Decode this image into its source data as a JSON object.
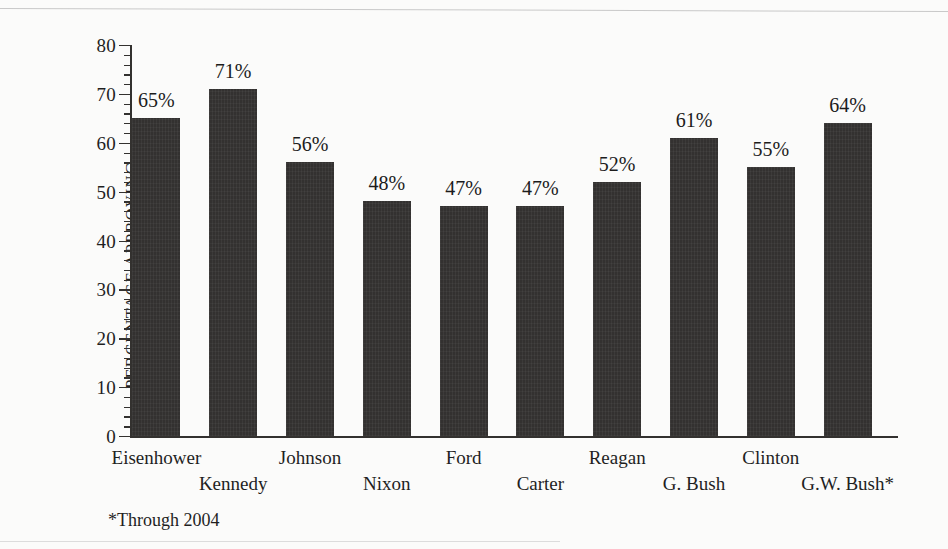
{
  "chart_data": {
    "type": "bar",
    "title": "",
    "xlabel": "",
    "ylabel": "PERCENTAGE APPROVING",
    "ylim": [
      0,
      80
    ],
    "ytick_step": 10,
    "yminor_step": 2,
    "grid": false,
    "legend": null,
    "bar_color": "#333130",
    "background_color": "#fbfbfa",
    "categories": [
      "Eisenhower",
      "Kennedy",
      "Johnson",
      "Nixon",
      "Ford",
      "Carter",
      "Reagan",
      "G. Bush",
      "Clinton",
      "G.W. Bush*"
    ],
    "values": [
      65,
      71,
      56,
      48,
      47,
      47,
      52,
      61,
      55,
      64
    ],
    "data_labels": [
      "65%",
      "71%",
      "56%",
      "48%",
      "47%",
      "47%",
      "52%",
      "61%",
      "55%",
      "64%"
    ],
    "ytick_labels": [
      "0",
      "10",
      "20",
      "30",
      "40",
      "50",
      "60",
      "70",
      "80"
    ],
    "ytick_values": [
      0,
      10,
      20,
      30,
      40,
      50,
      60,
      70,
      80
    ],
    "annotations": [
      "*Through 2004"
    ]
  },
  "footnote": "*Through 2004"
}
